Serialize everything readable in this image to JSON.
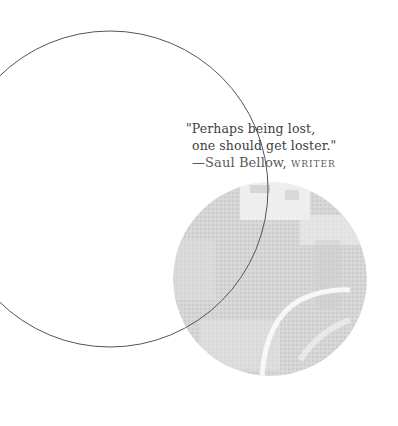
{
  "quote": {
    "line1": "\"Perhaps being lost,",
    "line2": "one should get loster.\"",
    "dash": "—",
    "author": "Saul Bellow,",
    "role": "WRITER"
  },
  "colors": {
    "background": "#ffffff",
    "outline_circle": "#555555",
    "textured_disc": "#d4d4d4",
    "text": "#3e3e3e"
  },
  "shapes": {
    "outline_circle": {
      "cx": 110,
      "cy": 189,
      "r": 158
    },
    "textured_disc": {
      "cx": 270,
      "cy": 279,
      "r": 97
    }
  }
}
